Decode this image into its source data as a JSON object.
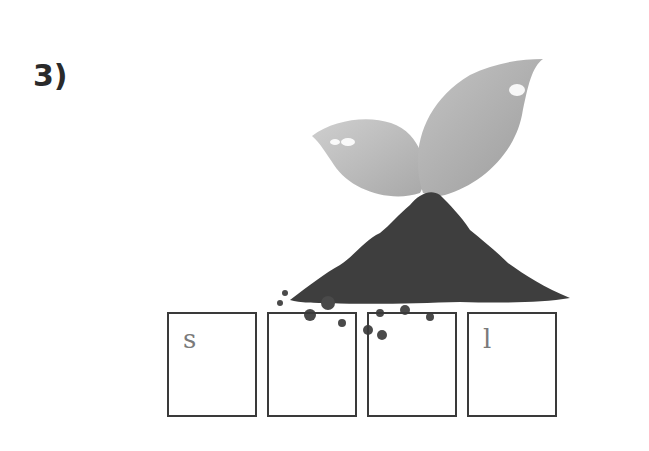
{
  "question": {
    "number_label": "3)"
  },
  "illustration": {
    "subject": "seedling-sprouting-from-soil-pile",
    "colors": {
      "leaf": "#b8b8b8",
      "soil": "#3e3e3e",
      "outline": "#3a3a3a"
    }
  },
  "word_boxes": [
    {
      "letter": "s"
    },
    {
      "letter": ""
    },
    {
      "letter": ""
    },
    {
      "letter": "l"
    }
  ]
}
